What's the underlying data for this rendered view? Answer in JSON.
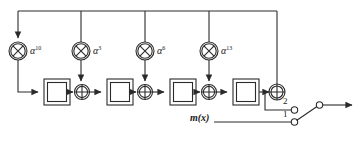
{
  "diagram": {
    "colors": {
      "line": "#2b2b2b",
      "text": "#1a1a1a",
      "background": "#ffffff"
    },
    "multipliers": [
      {
        "name": "multiplier-alpha-10",
        "symbol": "circled-times",
        "base": "α",
        "exponent": "10",
        "cx": 18,
        "cy": 51,
        "r": 9
      },
      {
        "name": "multiplier-alpha-3",
        "symbol": "circled-times",
        "base": "α",
        "exponent": "3",
        "cx": 81,
        "cy": 51,
        "r": 9
      },
      {
        "name": "multiplier-alpha-6",
        "symbol": "circled-times",
        "base": "α",
        "exponent": "6",
        "cx": 145,
        "cy": 51,
        "r": 9
      },
      {
        "name": "multiplier-alpha-13",
        "symbol": "circled-times",
        "base": "α",
        "exponent": "13",
        "cx": 209,
        "cy": 51,
        "r": 9
      }
    ],
    "registers": [
      {
        "name": "shift-register-1",
        "x": 44,
        "y": 79,
        "w": 26,
        "h": 26
      },
      {
        "name": "shift-register-2",
        "x": 107,
        "y": 79,
        "w": 26,
        "h": 26
      },
      {
        "name": "shift-register-3",
        "x": 170,
        "y": 79,
        "w": 26,
        "h": 26
      },
      {
        "name": "shift-register-4",
        "x": 233,
        "y": 79,
        "w": 26,
        "h": 26
      }
    ],
    "adders": [
      {
        "name": "xor-adder-1",
        "symbol": "circled-plus",
        "cx": 82,
        "cy": 92,
        "r": 7
      },
      {
        "name": "xor-adder-2",
        "symbol": "circled-plus",
        "cx": 145,
        "cy": 92,
        "r": 7
      },
      {
        "name": "xor-adder-3",
        "symbol": "circled-plus",
        "cx": 209,
        "cy": 92,
        "r": 7
      },
      {
        "name": "xor-adder-output",
        "symbol": "circled-plus",
        "cx": 277,
        "cy": 92,
        "r": 8
      }
    ],
    "switch": {
      "name": "output-switch",
      "position_2_label": "2",
      "position_1_label": "1",
      "selected": "1",
      "pole_x": 308,
      "pole_y": 118,
      "throw_x": 322,
      "throw_y": 105,
      "terminal2_x": 292,
      "terminal2_y": 110,
      "terminal1_x": 292,
      "terminal1_y": 122
    },
    "input": {
      "name": "message-input",
      "label": "m(x)",
      "label_x": 190,
      "label_y": 118
    },
    "feedback_bus": {
      "name": "feedback-bus",
      "y": 11,
      "x_start": 18,
      "x_end": 277
    }
  }
}
